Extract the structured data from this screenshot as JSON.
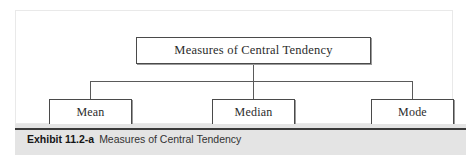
{
  "figure": {
    "root": {
      "label": "Measures of Central Tendency"
    },
    "children": [
      {
        "label": "Mean"
      },
      {
        "label": "Median"
      },
      {
        "label": "Mode"
      }
    ],
    "caption": {
      "exhibit_label": "Exhibit 11.2-a",
      "title": "Measures of Central Tendency"
    },
    "colors": {
      "panel_background": "#ffffff",
      "box_border": "#4a4a4a",
      "connector_line": "#5a5a5a",
      "caption_band": "#e4e4e4",
      "caption_rule": "#3a3a3a",
      "text": "#2b2b2b"
    }
  }
}
